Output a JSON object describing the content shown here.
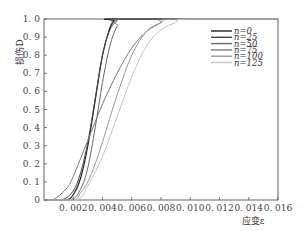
{
  "chart_data": {
    "type": "line",
    "title": "",
    "xlabel": "应变ε",
    "ylabel": "损伤D",
    "xlim": [
      0,
      0.016
    ],
    "ylim": [
      0,
      1.0
    ],
    "grid": false,
    "legend_position": "upper right",
    "x_ticks": [
      "0.002",
      "0.004",
      "0.006",
      "0.008",
      "0.010",
      "0.012",
      "0.014",
      "0.016"
    ],
    "y_ticks": [
      "0",
      "0.1",
      "0.2",
      "0.3",
      "0.4",
      "0.5",
      "0.6",
      "0.7",
      "0.8",
      "0.9",
      "1.0"
    ],
    "series": [
      {
        "name": "n=0",
        "color": "#222222",
        "width": 1.2,
        "x": [
          0.0,
          0.0015,
          0.002,
          0.0025,
          0.003,
          0.0035,
          0.004,
          0.0045,
          0.0048,
          0.005,
          0.016
        ],
        "y": [
          0.0,
          0.0,
          0.03,
          0.12,
          0.3,
          0.55,
          0.8,
          0.95,
          0.99,
          1.0,
          1.0
        ]
      },
      {
        "name": "n=25",
        "color": "#444444",
        "width": 1.0,
        "x": [
          0.0,
          0.0012,
          0.002,
          0.0025,
          0.003,
          0.0035,
          0.004,
          0.0045,
          0.005,
          0.0053,
          0.016
        ],
        "y": [
          0.0,
          0.0,
          0.05,
          0.15,
          0.32,
          0.56,
          0.8,
          0.94,
          0.99,
          1.0,
          1.0
        ]
      },
      {
        "name": "n=50",
        "color": "#666666",
        "width": 1.0,
        "x": [
          0.0,
          0.0018,
          0.0025,
          0.003,
          0.0035,
          0.004,
          0.0045,
          0.005,
          0.0055,
          0.016
        ],
        "y": [
          0.0,
          0.0,
          0.06,
          0.18,
          0.4,
          0.65,
          0.85,
          0.96,
          1.0,
          1.0
        ]
      },
      {
        "name": "n=75",
        "color": "#7a7a7a",
        "width": 1.0,
        "x": [
          0.0,
          0.0006,
          0.0015,
          0.002,
          0.003,
          0.004,
          0.005,
          0.006,
          0.007,
          0.008,
          0.0085,
          0.016
        ],
        "y": [
          0.0,
          0.0,
          0.06,
          0.13,
          0.33,
          0.53,
          0.7,
          0.84,
          0.93,
          0.98,
          1.0,
          1.0
        ]
      },
      {
        "name": "n=100",
        "color": "#999999",
        "width": 1.0,
        "x": [
          0.0,
          0.002,
          0.0025,
          0.003,
          0.0035,
          0.004,
          0.005,
          0.006,
          0.007,
          0.008,
          0.009,
          0.016
        ],
        "y": [
          0.0,
          0.0,
          0.04,
          0.1,
          0.2,
          0.32,
          0.58,
          0.8,
          0.93,
          0.98,
          1.0,
          1.0
        ]
      },
      {
        "name": "n=125",
        "color": "#c4c4c4",
        "width": 1.0,
        "x": [
          0.0,
          0.0022,
          0.003,
          0.004,
          0.005,
          0.006,
          0.007,
          0.008,
          0.009,
          0.0098,
          0.016
        ],
        "y": [
          0.0,
          0.0,
          0.08,
          0.24,
          0.46,
          0.68,
          0.85,
          0.94,
          0.98,
          1.0,
          1.0
        ]
      }
    ]
  }
}
